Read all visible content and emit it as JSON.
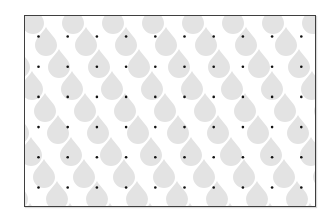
{
  "pattern": {
    "drop_color": "#e3e3e3",
    "dot_color": "#111111",
    "background_color": "#ffffff",
    "border_color": "#3f3f3f",
    "dot_grid": {
      "rows": 6,
      "columns": 10
    },
    "motif_drop": "teardrop",
    "motif_dot": "small-black-dot"
  }
}
